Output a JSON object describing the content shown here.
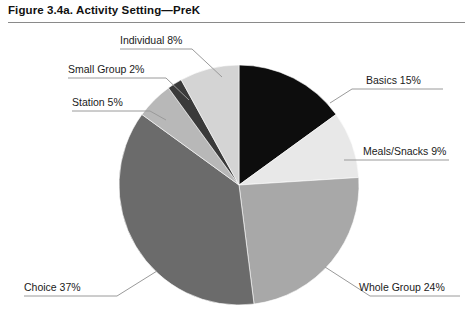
{
  "figure": {
    "title": "Figure 3.4a. Activity Setting—PreK"
  },
  "chart_data": {
    "type": "pie",
    "title": "Figure 3.4a. Activity Setting—PreK",
    "xlabel": "",
    "ylabel": "",
    "units": "percent",
    "total": 100,
    "start_angle_deg": 0,
    "direction": "clockwise",
    "legend": "none (direct callout labels with leader lines)",
    "categories": [
      "Basics",
      "Meals/Snacks",
      "Whole Group",
      "Choice",
      "Station",
      "Small Group",
      "Individual"
    ],
    "values": [
      15,
      9,
      24,
      37,
      5,
      2,
      8
    ],
    "labels": [
      "Basics 15%",
      "Meals/Snacks 9%",
      "Whole Group 24%",
      "Choice 37%",
      "Station 5%",
      "Small Group 2%",
      "Individual 8%"
    ],
    "colors": [
      "#0d0d0d",
      "#e8e8e8",
      "#a8a8a8",
      "#6b6b6b",
      "#b8b8b8",
      "#3a3a3a",
      "#d4d4d4"
    ],
    "slices": [
      {
        "name": "Basics",
        "label": "Basics 15%",
        "value": 15,
        "color": "#0d0d0d"
      },
      {
        "name": "Meals/Snacks",
        "label": "Meals/Snacks 9%",
        "value": 9,
        "color": "#e8e8e8"
      },
      {
        "name": "Whole Group",
        "label": "Whole Group 24%",
        "value": 24,
        "color": "#a8a8a8"
      },
      {
        "name": "Choice",
        "label": "Choice 37%",
        "value": 37,
        "color": "#6b6b6b"
      },
      {
        "name": "Station",
        "label": "Station 5%",
        "value": 5,
        "color": "#b8b8b8"
      },
      {
        "name": "Small Group",
        "label": "Small Group 2%",
        "value": 2,
        "color": "#3a3a3a"
      },
      {
        "name": "Individual",
        "label": "Individual 8%",
        "value": 8,
        "color": "#d4d4d4"
      }
    ]
  }
}
